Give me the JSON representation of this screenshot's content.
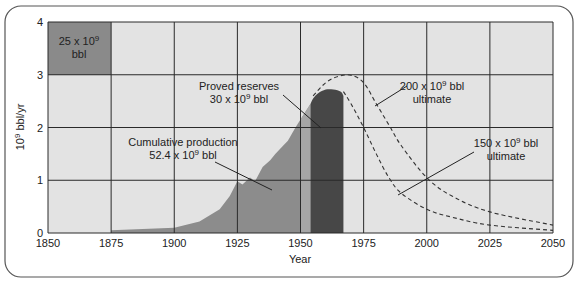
{
  "chart_data": {
    "type": "area",
    "title": "",
    "xlabel": "Year",
    "ylabel": "10^9 bbl/yr",
    "ylabel_parts": {
      "base": "10",
      "exp": "9",
      "rest": " bbl/yr"
    },
    "xlim": [
      1850,
      2050
    ],
    "ylim": [
      0,
      4
    ],
    "x_ticks": [
      1850,
      1875,
      1900,
      1925,
      1950,
      1975,
      2000,
      2025,
      2050
    ],
    "y_ticks": [
      0,
      1,
      2,
      3,
      4
    ],
    "grid": true,
    "series": [
      {
        "name": "Cumulative production",
        "kind": "filled-area",
        "color": "#8c8c8c",
        "x": [
          1875,
          1900,
          1910,
          1918,
          1922,
          1925,
          1927,
          1930,
          1932,
          1935,
          1938,
          1940,
          1943,
          1945,
          1948,
          1950,
          1954
        ],
        "values": [
          0.05,
          0.1,
          0.22,
          0.45,
          0.7,
          0.98,
          0.92,
          1.05,
          0.98,
          1.25,
          1.38,
          1.5,
          1.65,
          1.75,
          2.0,
          2.15,
          2.45
        ]
      },
      {
        "name": "Proved reserves",
        "kind": "filled-bar",
        "color": "#474747",
        "x": [
          1954,
          1955,
          1957,
          1960,
          1963,
          1966,
          1967
        ],
        "values": [
          2.45,
          2.55,
          2.65,
          2.72,
          2.72,
          2.68,
          2.6
        ]
      },
      {
        "name": "200 x 10^9 bbl ultimate",
        "kind": "dashed-line",
        "x": [
          1955,
          1960,
          1965,
          1970,
          1975,
          1980,
          1985,
          1990,
          2000,
          2010,
          2025,
          2050
        ],
        "values": [
          2.6,
          2.85,
          2.97,
          2.99,
          2.85,
          2.45,
          2.05,
          1.65,
          1.05,
          0.7,
          0.4,
          0.15
        ]
      },
      {
        "name": "150 x 10^9 bbl ultimate",
        "kind": "dashed-line",
        "x": [
          1967,
          1970,
          1975,
          1980,
          1985,
          1990,
          2000,
          2010,
          2025,
          2050
        ],
        "values": [
          2.68,
          2.45,
          2.0,
          1.5,
          1.05,
          0.75,
          0.45,
          0.3,
          0.15,
          0.05
        ]
      }
    ],
    "annotations": [
      {
        "id": "legend-box",
        "line1": "25 x 10",
        "exp": "9",
        "line1_end": "",
        "line2": "bbl",
        "note": "scale key: one grid cell = 25 x 10^9 bbl"
      },
      {
        "id": "proved",
        "line1": "Proved reserves",
        "line2_base": "30 x 10",
        "exp": "9",
        "line2_end": " bbl"
      },
      {
        "id": "cumulative",
        "line1": "Cumulative production",
        "line2_base": "52.4 x 10",
        "exp": "9",
        "line2_end": " bbl"
      },
      {
        "id": "ult200",
        "line1_base": "200 x 10",
        "exp": "9",
        "line1_end": " bbl",
        "line2": "ultimate"
      },
      {
        "id": "ult150",
        "line1_base": "150 x 10",
        "exp": "9",
        "line1_end": " bbl",
        "line2": "ultimate"
      }
    ],
    "colors": {
      "plot_bg": "#e3e3e3",
      "grid": "#2a2a2a",
      "key_box": "#8a8a8a",
      "production": "#8c8c8c",
      "production_recent": "#a6a6a6",
      "reserves": "#474747",
      "frame": "#555555"
    }
  }
}
